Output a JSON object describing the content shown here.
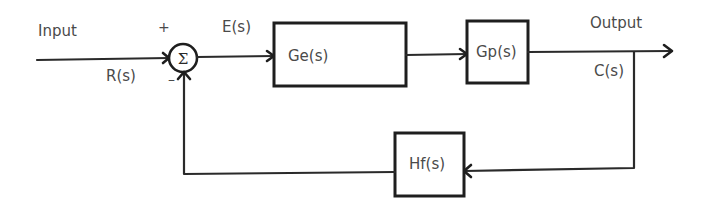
{
  "diagram": {
    "type": "feedback-control-block-diagram",
    "labels": {
      "input": "Input",
      "reference": "R(s)",
      "error": "E(s)",
      "output": "Output",
      "controlled": "C(s)",
      "plus_sign": "+",
      "minus_sign": "–"
    },
    "summing_junction": {
      "symbol": "Σ",
      "inputs": [
        "+",
        "-"
      ]
    },
    "blocks": [
      {
        "id": "controller",
        "label": "Ge(s)"
      },
      {
        "id": "plant",
        "label": "Gp(s)"
      },
      {
        "id": "feedback",
        "label": "Hf(s)"
      }
    ],
    "connections": [
      {
        "from": "input",
        "to": "summing_junction",
        "signal": "R(s)"
      },
      {
        "from": "summing_junction",
        "to": "controller",
        "signal": "E(s)"
      },
      {
        "from": "controller",
        "to": "plant"
      },
      {
        "from": "plant",
        "to": "output",
        "signal": "C(s)"
      },
      {
        "from": "output",
        "to": "feedback"
      },
      {
        "from": "feedback",
        "to": "summing_junction"
      }
    ]
  }
}
